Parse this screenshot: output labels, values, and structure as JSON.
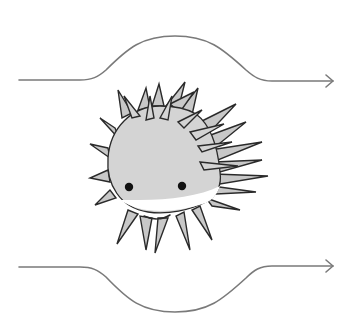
{
  "diagram": {
    "colors": {
      "line": "#7a7a7a",
      "outline": "#2a2a2a",
      "body_fill": "#d4d4d4",
      "spike_fill": "#c8c8c8",
      "background": "#ffffff",
      "eyes": "#111111"
    },
    "flow_lines": [
      {
        "id": "top",
        "direction": "right",
        "shape": "bulge-up",
        "arrow_icon": "arrow-right-icon"
      },
      {
        "id": "bottom",
        "direction": "right",
        "shape": "bulge-down",
        "arrow_icon": "arrow-right-icon"
      }
    ],
    "character": {
      "eyes": 2,
      "expression": "smile"
    }
  }
}
